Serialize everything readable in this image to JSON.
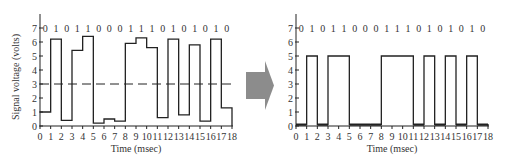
{
  "chart_data": [
    {
      "type": "line",
      "step": true,
      "title": "",
      "xlabel": "Time (msec)",
      "ylabel": "Signal voltage (volts)",
      "xlim": [
        0,
        18
      ],
      "ylim": [
        0,
        7
      ],
      "x_ticks": [
        0,
        1,
        2,
        3,
        4,
        5,
        6,
        7,
        8,
        9,
        10,
        11,
        12,
        13,
        14,
        15,
        16,
        17,
        18
      ],
      "y_ticks": [
        0,
        1,
        2,
        3,
        4,
        5,
        6,
        7
      ],
      "bits": [
        0,
        1,
        0,
        1,
        1,
        0,
        0,
        0,
        1,
        1,
        1,
        0,
        1,
        0,
        1,
        0,
        1,
        0
      ],
      "values": [
        1.0,
        6.2,
        0.4,
        5.4,
        6.4,
        0.2,
        0.5,
        0.35,
        5.9,
        6.3,
        5.6,
        0.6,
        6.2,
        0.8,
        5.8,
        0.35,
        6.2,
        1.3
      ],
      "threshold": 3,
      "threshold_style": "dashed",
      "description": "Noisy received analog signal"
    },
    {
      "type": "line",
      "step": true,
      "title": "",
      "xlabel": "Time (msec)",
      "ylabel": "",
      "xlim": [
        0,
        18
      ],
      "ylim": [
        0,
        7
      ],
      "x_ticks": [
        0,
        1,
        2,
        3,
        4,
        5,
        6,
        7,
        8,
        9,
        10,
        11,
        12,
        13,
        14,
        15,
        16,
        17,
        18
      ],
      "y_ticks": [
        0,
        1,
        2,
        3,
        4,
        5,
        6,
        7
      ],
      "bits": [
        0,
        1,
        0,
        1,
        1,
        0,
        0,
        0,
        1,
        1,
        1,
        0,
        1,
        0,
        1,
        0,
        1,
        0
      ],
      "values": [
        0.1,
        5,
        0.1,
        5,
        5,
        0.1,
        0.1,
        0.1,
        5,
        5,
        5,
        0.1,
        5,
        0.1,
        5,
        0.1,
        5,
        0.1
      ],
      "description": "Regenerated digital signal"
    }
  ],
  "arrow": {
    "color": "#8c8c8c",
    "direction": "right"
  },
  "colors": {
    "line": "#222222",
    "axis": "#222222",
    "text": "#333333"
  }
}
